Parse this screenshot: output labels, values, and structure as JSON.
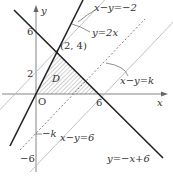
{
  "diagram": {
    "axes": {
      "x_label": "x",
      "y_label": "y",
      "origin_label": "O"
    },
    "ticks": {
      "y6": "6",
      "y2": "2",
      "x6": "6",
      "yneg6": "−6",
      "yk": "−k"
    },
    "point_label": "(2, 4)",
    "region_label": "D",
    "lines": {
      "l1": "x−y=−2",
      "l2": "y=2x",
      "l3": "x−y=k",
      "l4": "x−y=6",
      "l5": "y=−x+6"
    },
    "colors": {
      "bold": "#222222",
      "thin": "#b8b8b8",
      "axis": "#666666"
    }
  }
}
